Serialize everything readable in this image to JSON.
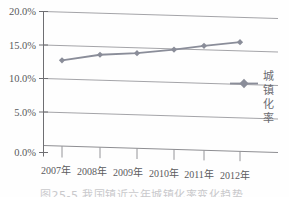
{
  "chart_data": {
    "type": "line",
    "title": "",
    "subtitle": "",
    "xlabel": "",
    "ylabel": "",
    "categories": [
      "2007年",
      "2008年",
      "2009年",
      "2010年",
      "2011年",
      "2012年"
    ],
    "series": [
      {
        "name": "城镇化率",
        "values": [
          12.8,
          13.8,
          14.2,
          14.9,
          15.6,
          16.3
        ],
        "color": "#8a8d99",
        "marker": "diamond"
      }
    ],
    "ylim": [
      0,
      20
    ],
    "yticks": [
      0,
      5,
      10,
      15,
      20
    ],
    "ytick_labels": [
      "0.0%",
      "5.0%",
      "10.0%",
      "15.0%",
      "20.0%"
    ],
    "grid": true,
    "grid_axis": "y",
    "legend_position": "right",
    "legend_orientation": "vertical-text",
    "value_format": "percent"
  },
  "legend": {
    "entries": [
      {
        "label": "城镇化率",
        "chars": [
          "城",
          "镇",
          "化",
          "率"
        ]
      }
    ]
  },
  "caption": {
    "text": "图25-5  我国镇近六年城镇化率变化趋势"
  },
  "colors": {
    "series_line": "#8a8d99",
    "gridline": "#8e8e92",
    "axis": "#6e6e72",
    "text": "#59595c",
    "background": "#fefefe"
  }
}
